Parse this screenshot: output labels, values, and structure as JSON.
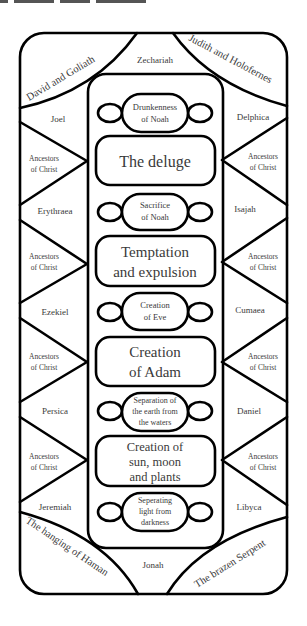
{
  "title_fragment_visible": true,
  "diagram": {
    "corners": {
      "top_left": "David and Goliath",
      "top_right": "Judith and Holofernes",
      "bottom_left": "The hanging of Haman",
      "bottom_right": "The brazen Serpent"
    },
    "top_center": "Zechariah",
    "bottom_center": "Jonah",
    "left_column": [
      {
        "label": "Joel",
        "kind": "prophet"
      },
      {
        "label": "Ancestors of Christ",
        "line1": "Ancestors",
        "line2": "of Christ",
        "kind": "ancestors"
      },
      {
        "label": "Erythraea",
        "kind": "sibyl"
      },
      {
        "label": "Ancestors of Christ",
        "line1": "Ancestors",
        "line2": "of Christ",
        "kind": "ancestors"
      },
      {
        "label": "Ezekiel",
        "kind": "prophet"
      },
      {
        "label": "Ancestors of Christ",
        "line1": "Ancestors",
        "line2": "of Christ",
        "kind": "ancestors"
      },
      {
        "label": "Persica",
        "kind": "sibyl"
      },
      {
        "label": "Ancestors of Christ",
        "line1": "Ancestors",
        "line2": "of Christ",
        "kind": "ancestors"
      },
      {
        "label": "Jeremiah",
        "kind": "prophet"
      }
    ],
    "right_column": [
      {
        "label": "Delphica",
        "kind": "sibyl"
      },
      {
        "label": "Ancestors of Christ",
        "line1": "Ancestors",
        "line2": "of Christ",
        "kind": "ancestors"
      },
      {
        "label": "Isajah",
        "kind": "prophet"
      },
      {
        "label": "Ancestors of Christ",
        "line1": "Ancestors",
        "line2": "of Christ",
        "kind": "ancestors"
      },
      {
        "label": "Cumaea",
        "kind": "sibyl"
      },
      {
        "label": "Ancestors of Christ",
        "line1": "Ancestors",
        "line2": "of Christ",
        "kind": "ancestors"
      },
      {
        "label": "Daniel",
        "kind": "prophet"
      },
      {
        "label": "Ancestors of Christ",
        "line1": "Ancestors",
        "line2": "of Christ",
        "kind": "ancestors"
      },
      {
        "label": "Libyca",
        "kind": "sibyl"
      }
    ],
    "center_panels": [
      {
        "size": "small",
        "lines": [
          "Drunkenness",
          "of Noah"
        ]
      },
      {
        "size": "large",
        "lines": [
          "The deluge"
        ]
      },
      {
        "size": "small",
        "lines": [
          "Sacrifice",
          "of Noah"
        ]
      },
      {
        "size": "large",
        "lines": [
          "Temptation",
          "and expulsion"
        ]
      },
      {
        "size": "small",
        "lines": [
          "Creation",
          "of Eve"
        ]
      },
      {
        "size": "large",
        "lines": [
          "Creation",
          "of Adam"
        ]
      },
      {
        "size": "small",
        "lines": [
          "Separation of",
          "the earth from",
          "the waters"
        ]
      },
      {
        "size": "large",
        "lines": [
          "Creation of",
          "sun, moon",
          "and plants"
        ]
      },
      {
        "size": "small",
        "lines": [
          "Seperating",
          "light from",
          "darkness"
        ]
      }
    ]
  },
  "colors": {
    "line": "#000000",
    "text": "#3a3a3a",
    "background": "#ffffff"
  }
}
